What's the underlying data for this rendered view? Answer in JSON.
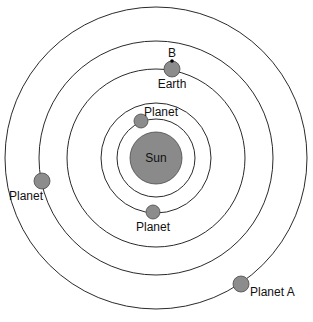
{
  "diagram": {
    "title": "",
    "center": {
      "x": 156,
      "y": 158
    },
    "colors": {
      "orbit": "#2a2a2a",
      "body": "#8c8c8c",
      "background": "#ffffff"
    },
    "orbits": [
      {
        "name": "orbit-1",
        "r": 39
      },
      {
        "name": "orbit-2",
        "r": 55
      },
      {
        "name": "orbit-3",
        "r": 89
      },
      {
        "name": "orbit-4",
        "r": 117
      },
      {
        "name": "orbit-5",
        "r": 151
      }
    ],
    "sun": {
      "label": "Sun",
      "r": 26
    },
    "point_b": {
      "label": "B",
      "x": 172,
      "y": 60
    },
    "bodies": [
      {
        "label": "Planet",
        "x": 141,
        "y": 121,
        "r": 7,
        "orbit": "orbit-1"
      },
      {
        "label": "Planet",
        "x": 153,
        "y": 212,
        "r": 7,
        "orbit": "orbit-2"
      },
      {
        "label": "Earth",
        "x": 172,
        "y": 69,
        "r": 8,
        "orbit": "orbit-3"
      },
      {
        "label": "Planet",
        "x": 42,
        "y": 181,
        "r": 8,
        "orbit": "orbit-4"
      },
      {
        "label": "Planet A",
        "x": 241,
        "y": 284,
        "r": 8,
        "orbit": "orbit-5"
      }
    ]
  }
}
